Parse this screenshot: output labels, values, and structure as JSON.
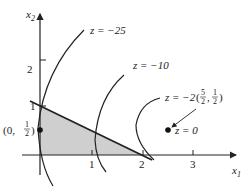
{
  "diagram": {
    "axes": {
      "x_label": "x",
      "x_sub": "1",
      "y_label": "x",
      "y_sub": "2",
      "x_ticks": [
        "1",
        "2",
        "3"
      ],
      "y_ticks": [
        "1",
        "2"
      ]
    },
    "contours": [
      {
        "label": "z = −25"
      },
      {
        "label": "z = −10"
      },
      {
        "label": "z = −2"
      },
      {
        "label": "z = 0"
      }
    ],
    "points": {
      "feasible_point": {
        "label_prefix": "(0, ",
        "num": "1",
        "den": "2",
        "label_suffix": ")"
      },
      "center_point": {
        "label_open": "(",
        "x_num": "5",
        "x_den": "2",
        "sep": ",",
        "y_num": "1",
        "y_den": "2",
        "label_close": ")"
      }
    },
    "colors": {
      "shade": "#cfcfcf",
      "line": "#222222"
    }
  }
}
